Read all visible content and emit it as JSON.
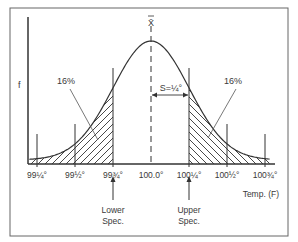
{
  "chart_data": {
    "type": "area",
    "title": "",
    "xlabel": "Temp. (F)",
    "ylabel": "f",
    "mean_label": "X̄",
    "mean": 100.0,
    "std_dev": 0.25,
    "sigma_label": "S=¼°",
    "x_range": [
      99.2,
      100.8
    ],
    "ticks": [
      {
        "value": 99.25,
        "label": "99¼°"
      },
      {
        "value": 99.5,
        "label": "99½°"
      },
      {
        "value": 99.75,
        "label": "99¾°"
      },
      {
        "value": 100.0,
        "label": "100.0°"
      },
      {
        "value": 100.25,
        "label": "100¼°"
      },
      {
        "value": 100.5,
        "label": "100½°"
      },
      {
        "value": 100.75,
        "label": "100¾°"
      }
    ],
    "spec_limits": {
      "lower": {
        "value": 99.75,
        "label_line1": "Lower",
        "label_line2": "Spec."
      },
      "upper": {
        "value": 100.25,
        "label_line1": "Upper",
        "label_line2": "Spec."
      }
    },
    "tail_annotations": [
      {
        "side": "left",
        "label": "16%"
      },
      {
        "side": "right",
        "label": "16%"
      }
    ],
    "grid": false,
    "legend": "none"
  }
}
